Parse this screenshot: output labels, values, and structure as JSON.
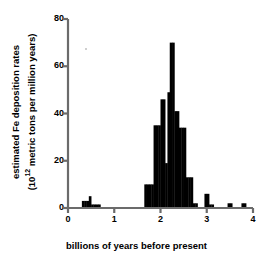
{
  "chart_data": {
    "type": "bar",
    "title": "",
    "subtitle": "",
    "xlabel": "billions of years before present",
    "ylabel": "estimated Fe deposition rates (10^12 metric tons per million years)",
    "ylabel_line1": "estimated Fe deposition rates",
    "ylabel_line2_pre": "(10",
    "ylabel_line2_sup": "12",
    "ylabel_line2_post": " metric tons per million years)",
    "xlim": [
      0,
      4
    ],
    "ylim": [
      0,
      80
    ],
    "xticks": [
      0,
      1,
      2,
      3,
      4
    ],
    "xtick_labels": [
      "0",
      "1",
      "2",
      "3",
      "4"
    ],
    "yticks": [
      0,
      20,
      40,
      60,
      80
    ],
    "ytick_labels": [
      "0",
      "20",
      "40",
      "60",
      "80"
    ],
    "grid": false,
    "legend": false,
    "legend_position": "none",
    "bar_color": "#000000",
    "axis_color": "#6b6b6b",
    "bin_width": 0.05,
    "bars": [
      {
        "x0": 0.3,
        "x1": 0.35,
        "value": 3
      },
      {
        "x0": 0.35,
        "x1": 0.4,
        "value": 3
      },
      {
        "x0": 0.4,
        "x1": 0.45,
        "value": 3
      },
      {
        "x0": 0.45,
        "x1": 0.5,
        "value": 5
      },
      {
        "x0": 0.5,
        "x1": 0.55,
        "value": 1.5
      },
      {
        "x0": 0.55,
        "x1": 0.6,
        "value": 1.5
      },
      {
        "x0": 0.6,
        "x1": 0.65,
        "value": 1.5
      },
      {
        "x0": 0.65,
        "x1": 0.7,
        "value": 1.5
      },
      {
        "x0": 1.65,
        "x1": 1.7,
        "value": 10
      },
      {
        "x0": 1.7,
        "x1": 1.75,
        "value": 10
      },
      {
        "x0": 1.75,
        "x1": 1.8,
        "value": 10
      },
      {
        "x0": 1.8,
        "x1": 1.85,
        "value": 10
      },
      {
        "x0": 1.85,
        "x1": 1.9,
        "value": 35
      },
      {
        "x0": 1.9,
        "x1": 1.95,
        "value": 35
      },
      {
        "x0": 1.95,
        "x1": 2.0,
        "value": 35
      },
      {
        "x0": 2.0,
        "x1": 2.05,
        "value": 46
      },
      {
        "x0": 2.05,
        "x1": 2.1,
        "value": 46
      },
      {
        "x0": 2.1,
        "x1": 2.15,
        "value": 19
      },
      {
        "x0": 2.15,
        "x1": 2.2,
        "value": 49
      },
      {
        "x0": 2.2,
        "x1": 2.25,
        "value": 70
      },
      {
        "x0": 2.25,
        "x1": 2.3,
        "value": 70
      },
      {
        "x0": 2.3,
        "x1": 2.35,
        "value": 41
      },
      {
        "x0": 2.35,
        "x1": 2.4,
        "value": 41
      },
      {
        "x0": 2.4,
        "x1": 2.45,
        "value": 34
      },
      {
        "x0": 2.45,
        "x1": 2.5,
        "value": 34
      },
      {
        "x0": 2.5,
        "x1": 2.55,
        "value": 34
      },
      {
        "x0": 2.55,
        "x1": 2.6,
        "value": 13
      },
      {
        "x0": 2.6,
        "x1": 2.65,
        "value": 13
      },
      {
        "x0": 2.65,
        "x1": 2.7,
        "value": 13
      },
      {
        "x0": 2.7,
        "x1": 2.75,
        "value": 2
      },
      {
        "x0": 2.75,
        "x1": 2.8,
        "value": 2
      },
      {
        "x0": 2.95,
        "x1": 3.0,
        "value": 6
      },
      {
        "x0": 3.0,
        "x1": 3.05,
        "value": 6
      },
      {
        "x0": 3.05,
        "x1": 3.1,
        "value": 1.5
      },
      {
        "x0": 3.1,
        "x1": 3.15,
        "value": 1.5
      },
      {
        "x0": 3.45,
        "x1": 3.5,
        "value": 2
      },
      {
        "x0": 3.5,
        "x1": 3.55,
        "value": 2
      },
      {
        "x0": 3.75,
        "x1": 3.8,
        "value": 2
      },
      {
        "x0": 3.8,
        "x1": 3.85,
        "value": 2
      }
    ],
    "peak_value": 70,
    "peak_x": 2.25
  }
}
